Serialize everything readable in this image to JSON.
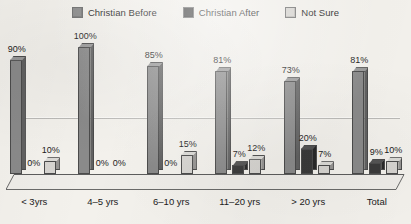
{
  "legend": {
    "items": [
      {
        "label": "Christian Before",
        "color": "#8a8a8a",
        "icon": "legend-swatch-icon"
      },
      {
        "label": "Christian After",
        "color": "#3a3a3a",
        "icon": "legend-swatch-icon"
      },
      {
        "label": "Not Sure",
        "color": "#d6d4d0",
        "icon": "legend-swatch-icon"
      }
    ]
  },
  "chart_data": {
    "type": "bar",
    "title": "",
    "subtitle": "",
    "xlabel": "",
    "ylabel": "",
    "ylim": [
      0,
      100
    ],
    "grid": true,
    "legend_position": "top-center",
    "style": "3d-clustered-column",
    "categories": [
      "< 3yrs",
      "4–5 yrs",
      "6–10 yrs",
      "11–20 yrs",
      "> 20 yrs",
      "Total"
    ],
    "series": [
      {
        "name": "Christian Before",
        "color": "#8a8a8a",
        "values": [
          90,
          100,
          85,
          81,
          73,
          81
        ],
        "labels": [
          "90%",
          "100%",
          "85%",
          "81%",
          "73%",
          "81%"
        ]
      },
      {
        "name": "Christian After",
        "color": "#3a3a3a",
        "values": [
          0,
          0,
          0,
          7,
          20,
          9
        ],
        "labels": [
          "0%",
          "0%",
          "0%",
          "7%",
          "20%",
          "9%"
        ]
      },
      {
        "name": "Not Sure",
        "color": "#d6d4d0",
        "values": [
          10,
          0,
          15,
          12,
          7,
          10
        ],
        "labels": [
          "10%",
          "0%",
          "15%",
          "12%",
          "7%",
          "10%"
        ]
      }
    ]
  },
  "axis": {
    "tick_labels": [
      "< 3yrs",
      "4–5 yrs",
      "6–10 yrs",
      "11–20 yrs",
      "> 20 yrs",
      "Total"
    ]
  }
}
